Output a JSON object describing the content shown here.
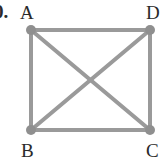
{
  "problem_number": "0.",
  "diagram": {
    "stroke_color": "#9a9a9a",
    "vertex_color": "#8f8f8f",
    "vertices": [
      {
        "label": "A",
        "x": 31,
        "y": 30
      },
      {
        "label": "D",
        "x": 150,
        "y": 30
      },
      {
        "label": "B",
        "x": 31,
        "y": 130
      },
      {
        "label": "C",
        "x": 150,
        "y": 130
      }
    ],
    "edges": [
      [
        "A",
        "D"
      ],
      [
        "D",
        "C"
      ],
      [
        "C",
        "B"
      ],
      [
        "B",
        "A"
      ],
      [
        "A",
        "C"
      ],
      [
        "B",
        "D"
      ]
    ]
  },
  "labels": {
    "a": "A",
    "b": "B",
    "c": "C",
    "d": "D"
  }
}
